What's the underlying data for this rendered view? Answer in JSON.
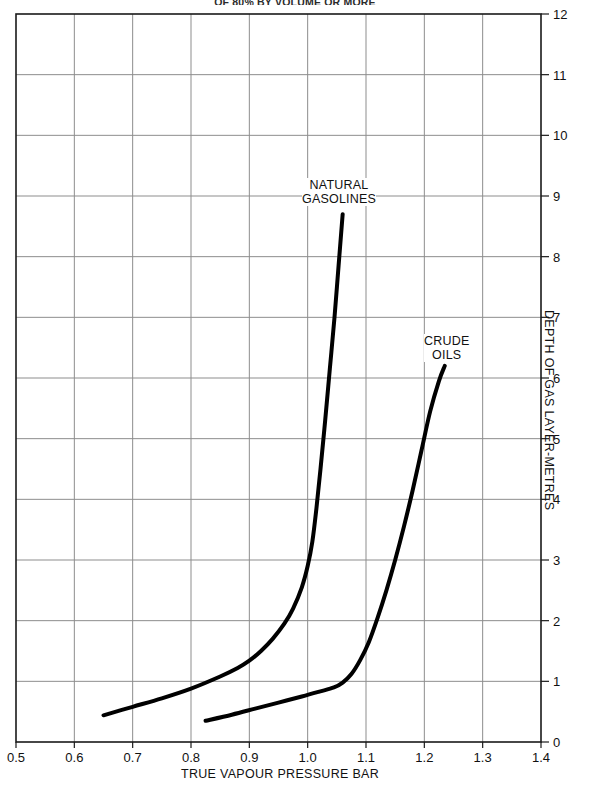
{
  "title": {
    "top_clipped": "OF 80% BY VOLUME OR MORE"
  },
  "axes": {
    "x_title": "TRUE VAPOUR PRESSURE BAR",
    "y_title": "DEPTH OF GAS LAYER-METRES",
    "x_ticks": [
      "0.5",
      "0.6",
      "0.7",
      "0.8",
      "0.9",
      "1.0",
      "1.1",
      "1.2",
      "1.3",
      "1.4"
    ],
    "y_ticks": [
      "0",
      "1",
      "2",
      "3",
      "4",
      "5",
      "6",
      "7",
      "8",
      "9",
      "10",
      "11",
      "12"
    ]
  },
  "labels": {
    "natural_gasolines_line1": "NATURAL",
    "natural_gasolines_line2": "GASOLINES",
    "crude_oils_line1": "CRUDE",
    "crude_oils_line2": "OILS"
  },
  "colors": {
    "curve": "#000000",
    "grid": "#8d8d8d",
    "frame": "#1a1a1a",
    "background": "#ffffff"
  },
  "chart_data": {
    "type": "line",
    "title": "OF 80% BY VOLUME OR MORE",
    "xlabel": "TRUE VAPOUR PRESSURE BAR",
    "ylabel": "DEPTH OF GAS LAYER-METRES",
    "xlim": [
      0.5,
      1.4
    ],
    "ylim": [
      0,
      12
    ],
    "xticks": [
      0.5,
      0.6,
      0.7,
      0.8,
      0.9,
      1.0,
      1.1,
      1.2,
      1.3,
      1.4
    ],
    "yticks": [
      0,
      1,
      2,
      3,
      4,
      5,
      6,
      7,
      8,
      9,
      10,
      11,
      12
    ],
    "grid": true,
    "legend": "inline-annotations",
    "y_axis_side": "right",
    "series": [
      {
        "name": "NATURAL GASOLINES",
        "points": [
          [
            0.65,
            0.44
          ],
          [
            0.7,
            0.58
          ],
          [
            0.75,
            0.72
          ],
          [
            0.8,
            0.88
          ],
          [
            0.85,
            1.08
          ],
          [
            0.88,
            1.22
          ],
          [
            0.9,
            1.34
          ],
          [
            0.92,
            1.5
          ],
          [
            0.94,
            1.7
          ],
          [
            0.96,
            1.95
          ],
          [
            0.975,
            2.2
          ],
          [
            0.99,
            2.55
          ],
          [
            1.0,
            2.9
          ],
          [
            1.008,
            3.3
          ],
          [
            1.015,
            3.85
          ],
          [
            1.022,
            4.5
          ],
          [
            1.03,
            5.3
          ],
          [
            1.038,
            6.15
          ],
          [
            1.046,
            7.0
          ],
          [
            1.053,
            7.85
          ],
          [
            1.06,
            8.7
          ]
        ]
      },
      {
        "name": "CRUDE OILS",
        "points": [
          [
            0.825,
            0.35
          ],
          [
            0.87,
            0.45
          ],
          [
            0.91,
            0.55
          ],
          [
            0.95,
            0.65
          ],
          [
            0.99,
            0.75
          ],
          [
            1.02,
            0.83
          ],
          [
            1.045,
            0.9
          ],
          [
            1.06,
            0.98
          ],
          [
            1.075,
            1.12
          ],
          [
            1.09,
            1.35
          ],
          [
            1.105,
            1.65
          ],
          [
            1.12,
            2.05
          ],
          [
            1.135,
            2.5
          ],
          [
            1.15,
            3.0
          ],
          [
            1.165,
            3.55
          ],
          [
            1.18,
            4.15
          ],
          [
            1.195,
            4.8
          ],
          [
            1.21,
            5.45
          ],
          [
            1.225,
            5.95
          ],
          [
            1.235,
            6.2
          ]
        ]
      }
    ]
  }
}
